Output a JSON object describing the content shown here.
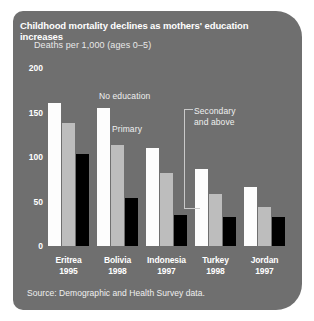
{
  "panel": {
    "background_color": "#6f6f6f",
    "title": "Childhood mortality declines as mothers' education increases",
    "subtitle": "Deaths per 1,000 (ages 0–5)",
    "source": "Source: Demographic and Health Survey data."
  },
  "chart_data": {
    "type": "bar",
    "title": "Childhood mortality declines as mothers' education increases",
    "subtitle": "Deaths per 1,000 (ages 0–5)",
    "xlabel": "",
    "ylabel": "Deaths per 1,000 (ages 0–5)",
    "ylim": [
      0,
      200
    ],
    "yticks": [
      0,
      50,
      100,
      150,
      200
    ],
    "ytick_labels": [
      "0",
      "50",
      "100",
      "150",
      "200"
    ],
    "grid": false,
    "legend_position": "annotations-inline",
    "categories": [
      "Eritrea 1995",
      "Bolivia 1998",
      "Indonesia 1997",
      "Turkey 1998",
      "Jordan 1997"
    ],
    "category_names": [
      "Eritrea",
      "Bolivia",
      "Indonesia",
      "Turkey",
      "Jordan"
    ],
    "category_years": [
      "1995",
      "1998",
      "1997",
      "1998",
      "1997"
    ],
    "series": [
      {
        "name": "No education",
        "color": "#fdfdfd",
        "values": [
          161,
          155,
          110,
          87,
          66
        ]
      },
      {
        "name": "Primary",
        "color": "#bdbdbd",
        "values": [
          138,
          113,
          82,
          58,
          44
        ]
      },
      {
        "name": "Secondary and above",
        "color": "#000000",
        "values": [
          103,
          54,
          35,
          33,
          33
        ]
      }
    ],
    "annotations": [
      {
        "text": "No education",
        "series": "No education"
      },
      {
        "text": "Primary",
        "series": "Primary"
      },
      {
        "text": "Secondary\nand above",
        "series": "Secondary and above"
      }
    ],
    "source": "Source: Demographic and Health Survey data."
  }
}
